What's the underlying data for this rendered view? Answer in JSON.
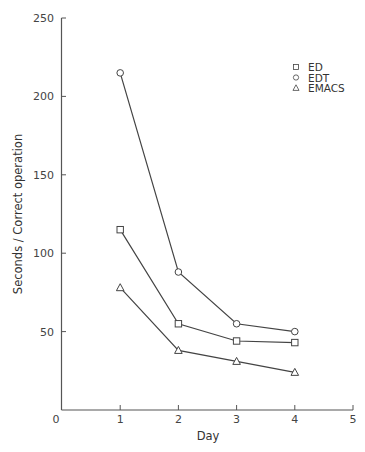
{
  "chart_data": {
    "type": "line",
    "title": "",
    "xlabel": "Day",
    "ylabel": "Seconds / Correct operation",
    "x": [
      1,
      2,
      3,
      4
    ],
    "xlim": [
      0,
      5
    ],
    "ylim": [
      0,
      250
    ],
    "xticks": [
      "0",
      "1",
      "2",
      "3",
      "4",
      "5"
    ],
    "yticks": [
      "50",
      "100",
      "150",
      "200",
      "250"
    ],
    "y_zero_label": "0",
    "grid": false,
    "legend_position": "upper right",
    "series": [
      {
        "name": "ED",
        "marker": "square",
        "values": [
          115,
          55,
          44,
          43
        ]
      },
      {
        "name": "EDT",
        "marker": "circle",
        "values": [
          215,
          88,
          55,
          50
        ]
      },
      {
        "name": "EMACS",
        "marker": "triangle",
        "values": [
          78,
          38,
          31,
          24
        ]
      }
    ]
  },
  "legend": [
    {
      "label": "ED",
      "marker": "square"
    },
    {
      "label": "EDT",
      "marker": "circle"
    },
    {
      "label": "EMACS",
      "marker": "triangle"
    }
  ],
  "colors": {
    "line": "#444444",
    "text": "#333333"
  }
}
